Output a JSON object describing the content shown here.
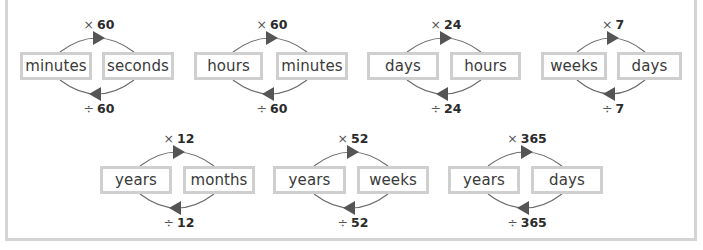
{
  "colors": {
    "box_border": "#cfcfcf",
    "frame_border": "#d4d4d4",
    "arc": "#6a6a6a",
    "arrowhead": "#555555",
    "text": "#3a3a3a"
  },
  "conversions": [
    {
      "left": "minutes",
      "right": "seconds",
      "multiply": {
        "symbol": "×",
        "value": "60"
      },
      "divide": {
        "symbol": "÷",
        "value": "60"
      }
    },
    {
      "left": "hours",
      "right": "minutes",
      "multiply": {
        "symbol": "×",
        "value": "60"
      },
      "divide": {
        "symbol": "÷",
        "value": "60"
      }
    },
    {
      "left": "days",
      "right": "hours",
      "multiply": {
        "symbol": "×",
        "value": "24"
      },
      "divide": {
        "symbol": "÷",
        "value": "24"
      }
    },
    {
      "left": "weeks",
      "right": "days",
      "multiply": {
        "symbol": "×",
        "value": "7"
      },
      "divide": {
        "symbol": "÷",
        "value": "7"
      }
    },
    {
      "left": "years",
      "right": "months",
      "multiply": {
        "symbol": "×",
        "value": "12"
      },
      "divide": {
        "symbol": "÷",
        "value": "12"
      }
    },
    {
      "left": "years",
      "right": "weeks",
      "multiply": {
        "symbol": "×",
        "value": "52"
      },
      "divide": {
        "symbol": "÷",
        "value": "52"
      }
    },
    {
      "left": "years",
      "right": "days",
      "multiply": {
        "symbol": "×",
        "value": "365"
      },
      "divide": {
        "symbol": "÷",
        "value": "365"
      }
    }
  ]
}
